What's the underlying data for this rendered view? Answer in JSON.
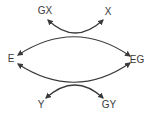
{
  "diagram": {
    "nodes": [
      {
        "id": "GX",
        "label": "GX",
        "x": 45,
        "y": 11
      },
      {
        "id": "X",
        "label": "X",
        "x": 108,
        "y": 12
      },
      {
        "id": "E",
        "label": "E",
        "x": 11,
        "y": 59
      },
      {
        "id": "EG",
        "label": "EG",
        "x": 137,
        "y": 60
      },
      {
        "id": "Y",
        "label": "Y",
        "x": 41,
        "y": 105
      },
      {
        "id": "GY",
        "label": "GY",
        "x": 109,
        "y": 105
      }
    ],
    "edges": [
      {
        "name": "top-coupled-reaction",
        "main": "E → EG",
        "coupled": "GX → X",
        "direction": "both arrows: to E and to EG; to GX and to X"
      },
      {
        "name": "bottom-coupled-reaction",
        "main": "EG → E",
        "coupled": "Y → GY",
        "direction": "both arrows: to E and to EG; to Y and to GY"
      }
    ],
    "colors": {
      "stroke": "#3a3a3a",
      "text": "#3a3a3a",
      "background": "#ffffff"
    }
  }
}
